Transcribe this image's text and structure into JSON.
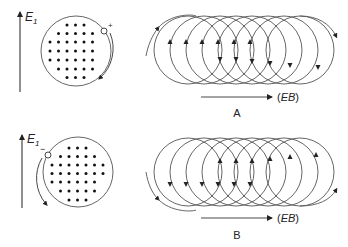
{
  "figure": {
    "panels": [
      {
        "id": "A",
        "label": "A",
        "field_label": "E",
        "field_subscript": "1",
        "particle_charge": "+",
        "drift_label_open": "(",
        "drift_label_main": "EB",
        "drift_label_close": ")",
        "gyration": "clockwise-right-side",
        "spiral_direction": "counter-clockwise loops drifting right"
      },
      {
        "id": "B",
        "label": "B",
        "field_label": "E",
        "field_subscript": "1",
        "particle_charge": "−",
        "drift_label_open": "(",
        "drift_label_main": "EB",
        "drift_label_close": ")",
        "gyration": "counter-clockwise-left-side",
        "spiral_direction": "clockwise loops drifting right"
      }
    ],
    "dot_grid_rows": [
      3,
      5,
      6,
      6,
      6,
      5,
      3
    ],
    "spiral_loops": 8,
    "colors": {
      "line": "#555555",
      "dot": "#111111",
      "text": "#222222"
    }
  }
}
